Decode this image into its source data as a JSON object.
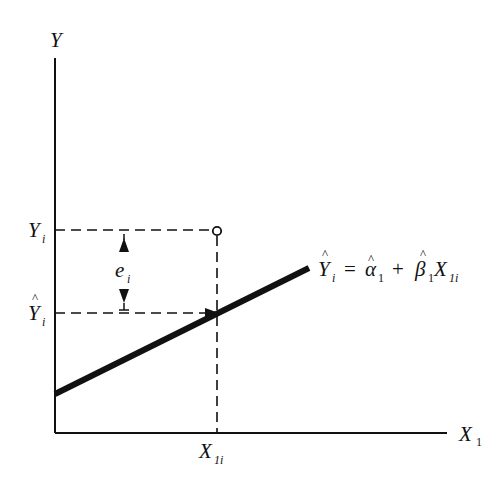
{
  "diagram": {
    "type": "regression-residual-illustration",
    "axes": {
      "y_label": "Y",
      "x_label": "X",
      "x_label_sub": "1"
    },
    "levels": {
      "observed_label": "Y",
      "observed_sub": "i",
      "fitted_label": "Y",
      "fitted_hat": "^",
      "fitted_sub": "i"
    },
    "residual": {
      "label": "e",
      "sub": "i"
    },
    "x_point": {
      "label": "X",
      "sub": "1i"
    },
    "equation": {
      "lhs": "Y",
      "lhs_sub": "i",
      "equals": "=",
      "alpha": "α",
      "alpha_sub": "1",
      "plus": "+",
      "beta": "β",
      "beta_sub": "1",
      "x": "X",
      "x_sub": "1i",
      "hat": "^"
    },
    "colors": {
      "ink": "#111111",
      "background": "#ffffff"
    }
  }
}
